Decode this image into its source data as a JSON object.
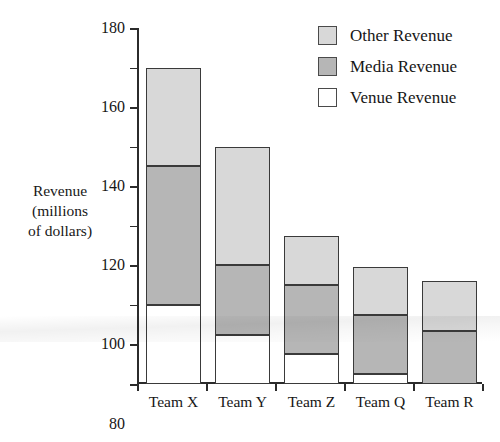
{
  "chart_data": {
    "type": "bar",
    "subtype": "stacked-bar",
    "title": "",
    "xlabel": "",
    "ylabel": "Revenue (millions of dollars)",
    "ylabel_lines": [
      "Revenue",
      "(millions",
      "of dollars)"
    ],
    "categories": [
      "Team X",
      "Team Y",
      "Team Z",
      "Team Q",
      "Team R"
    ],
    "series": [
      {
        "name": "Venue Revenue",
        "color": "#ffffff",
        "values": [
          40,
          25,
          15,
          5,
          0
        ]
      },
      {
        "name": "Media Revenue",
        "color": "#b6b6b6",
        "values": [
          70,
          35,
          35,
          30,
          27
        ]
      },
      {
        "name": "Other Revenue",
        "color": "#d8d8d8",
        "values": [
          50,
          60,
          25,
          24,
          25
        ]
      }
    ],
    "totals": [
      160,
      120,
      75,
      59,
      52
    ],
    "stack_order_bottom_to_top": [
      "Venue Revenue",
      "Media Revenue",
      "Other Revenue"
    ],
    "ylim": [
      0,
      180
    ],
    "ytick_step": 20,
    "yticks": [
      0,
      20,
      40,
      60,
      80,
      100,
      120,
      140,
      160,
      180
    ],
    "ytick_labels": [
      "0",
      "20",
      "40",
      "60",
      "80",
      "100",
      "120",
      "140",
      "160",
      "180"
    ],
    "grid": false,
    "legend_position": "top-right",
    "legend": [
      {
        "label": "Other Revenue",
        "color": "#d8d8d8"
      },
      {
        "label": "Media Revenue",
        "color": "#b6b6b6"
      },
      {
        "label": "Venue Revenue",
        "color": "#ffffff"
      }
    ]
  }
}
